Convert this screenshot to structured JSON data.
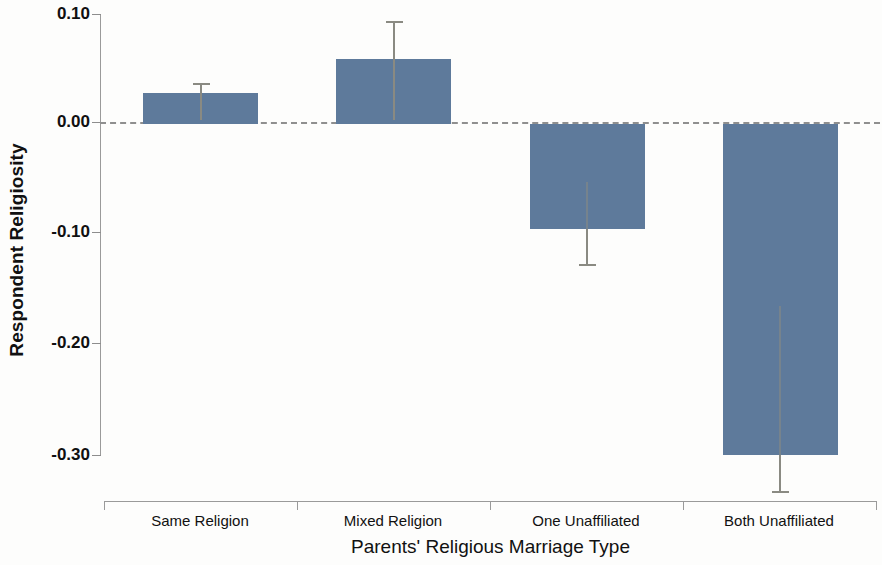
{
  "chart_data": {
    "type": "bar",
    "title": "",
    "xlabel": "Parents' Religious Marriage Type",
    "ylabel": "Respondent Religiosity",
    "categories": [
      "Same Religion",
      "Mixed Religion",
      "One Unaffiliated",
      "Both Unaffiliated"
    ],
    "values": [
      0.028,
      0.059,
      -0.095,
      -0.3
    ],
    "errors_upper": [
      0.037,
      0.094,
      -0.095,
      -0.3
    ],
    "errors_lower": [
      0.028,
      0.059,
      -0.127,
      -0.333
    ],
    "ylim": [
      -0.3,
      0.1
    ],
    "yticks": [
      0.1,
      0.0,
      -0.1,
      -0.2,
      -0.3
    ],
    "ytick_labels": [
      "0.10",
      "0.00",
      "-0.10",
      "-0.20",
      "-0.30"
    ],
    "grid": false,
    "legend": "none",
    "zero_reference_line": true,
    "bar_color": "#5e7a9b",
    "error_color": "#8a8a82",
    "axis_color": "#9a9a9a"
  },
  "axes": {
    "y_label": "Respondent Religiosity",
    "x_label": "Parents' Religious Marriage Type",
    "y_ticks": [
      {
        "label": "0.10",
        "value": 0.1
      },
      {
        "label": "0.00",
        "value": 0.0
      },
      {
        "label": "-0.10",
        "value": -0.1
      },
      {
        "label": "-0.20",
        "value": -0.2
      },
      {
        "label": "-0.30",
        "value": -0.3
      }
    ],
    "x_categories": [
      {
        "label": "Same Religion"
      },
      {
        "label": "Mixed Religion"
      },
      {
        "label": "One Unaffiliated"
      },
      {
        "label": "Both Unaffiliated"
      }
    ]
  }
}
